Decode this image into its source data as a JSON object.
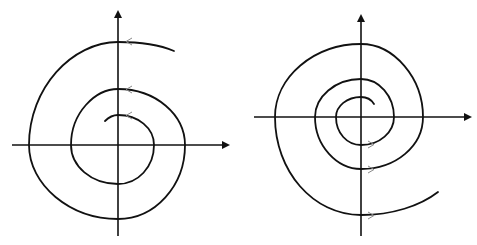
{
  "figure": {
    "panels": [
      {
        "id": "left",
        "type": "outward spiral",
        "flow_direction": "counterclockwise (arrows point left at top crossings)",
        "arrow_glyph": "<",
        "colors": {
          "curve": "#111111",
          "axes": "#111111",
          "arrows": "#8a8a8a"
        }
      },
      {
        "id": "right",
        "type": "outward spiral",
        "flow_direction": "counterclockwise (arrows point right at bottom crossings)",
        "arrow_glyph": ">",
        "colors": {
          "curve": "#111111",
          "axes": "#111111",
          "arrows": "#8a8a8a"
        }
      }
    ]
  }
}
